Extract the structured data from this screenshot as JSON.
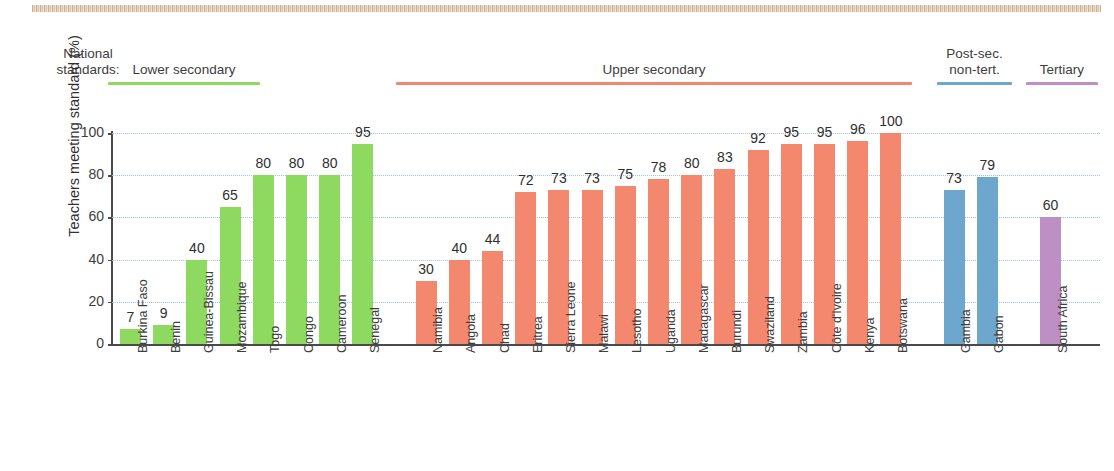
{
  "legend": {
    "caption": "National\nstandards:",
    "caption_line1": "National",
    "caption_line2": "standards:",
    "items": [
      {
        "label": "Lower secondary",
        "color": "#8ed95f"
      },
      {
        "label": "Upper secondary",
        "color": "#f4886e"
      },
      {
        "label": "Post-sec.\nnon-tert.",
        "line1": "Post-sec.",
        "line2": "non-tert.",
        "color": "#6ea7ce"
      },
      {
        "label": "Tertiary",
        "color": "#bd8fc4"
      }
    ]
  },
  "chart_data": {
    "type": "bar",
    "title": "",
    "xlabel": "",
    "ylabel": "Teachers meeting standard (%)",
    "ylim": [
      0,
      100
    ],
    "yticks": [
      0,
      20,
      40,
      60,
      80,
      100
    ],
    "grid": true,
    "legend_position": "top",
    "categories": [
      "Burkina Faso",
      "Benin",
      "Guinea-Bissau",
      "Mozambique",
      "Togo",
      "Congo",
      "Cameroon",
      "Senegal",
      "Namibia",
      "Angola",
      "Chad",
      "Eritrea",
      "Sierra Leone",
      "Malawi",
      "Lesotho",
      "Uganda",
      "Madagascar",
      "Burundi",
      "Swaziland",
      "Zambia",
      "Côte d'Ivoire",
      "Kenya",
      "Botswana",
      "Gambia",
      "Gabon",
      "South Africa"
    ],
    "values": [
      7,
      9,
      40,
      65,
      80,
      80,
      80,
      95,
      30,
      40,
      44,
      72,
      73,
      73,
      75,
      78,
      80,
      83,
      92,
      95,
      95,
      96,
      100,
      73,
      79,
      60
    ],
    "groups": [
      {
        "name": "Lower secondary",
        "color": "#8ed95f",
        "categories": [
          "Burkina Faso",
          "Benin",
          "Guinea-Bissau",
          "Mozambique",
          "Togo",
          "Congo",
          "Cameroon",
          "Senegal"
        ],
        "values": [
          7,
          9,
          40,
          65,
          80,
          80,
          80,
          95
        ]
      },
      {
        "name": "Upper secondary",
        "color": "#f4886e",
        "categories": [
          "Namibia",
          "Angola",
          "Chad",
          "Eritrea",
          "Sierra Leone",
          "Malawi",
          "Lesotho",
          "Uganda",
          "Madagascar",
          "Burundi",
          "Swaziland",
          "Zambia",
          "Côte d'Ivoire",
          "Kenya",
          "Botswana"
        ],
        "values": [
          30,
          40,
          44,
          72,
          73,
          73,
          75,
          78,
          80,
          83,
          92,
          95,
          95,
          96,
          100
        ]
      },
      {
        "name": "Post-sec. non-tert.",
        "color": "#6ea7ce",
        "categories": [
          "Gambia",
          "Gabon"
        ],
        "values": [
          73,
          79
        ]
      },
      {
        "name": "Tertiary",
        "color": "#bd8fc4",
        "categories": [
          "South Africa"
        ],
        "values": [
          60
        ]
      }
    ]
  }
}
